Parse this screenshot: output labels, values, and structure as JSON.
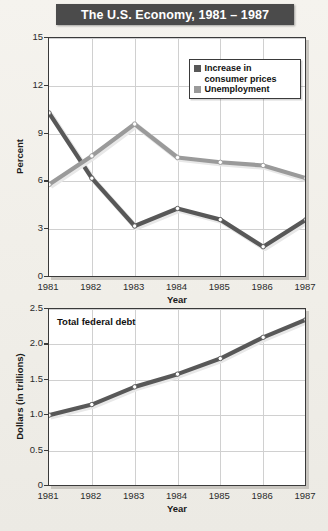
{
  "title": "The U.S. Economy, 1981 – 1987",
  "colors": {
    "consumer_prices": "#585858",
    "unemployment": "#9a9a9a",
    "federal_debt": "#585858",
    "banner_bg": "#4b4b4b",
    "banner_text": "#ffffff",
    "page_bg": "#f1efe9",
    "grid": "#d0d0d0",
    "frame": "#3a3a3a"
  },
  "legend": {
    "items": [
      {
        "label": "Increase in\nconsumer prices",
        "color_key": "consumer_prices"
      },
      {
        "label": "Unemployment",
        "color_key": "unemployment"
      }
    ]
  },
  "chart_data": [
    {
      "id": "economy-indicators",
      "type": "line",
      "title": "The U.S. Economy, 1981 – 1987",
      "xlabel": "Year",
      "ylabel": "Percent",
      "categories": [
        "1981",
        "1982",
        "1983",
        "1984",
        "1985",
        "1986",
        "1987"
      ],
      "x": [
        1981,
        1982,
        1983,
        1984,
        1985,
        1986,
        1987
      ],
      "ylim": [
        0,
        15
      ],
      "yticks": [
        "0",
        "3",
        "6",
        "9",
        "12",
        "15"
      ],
      "ytick_values": [
        0,
        3,
        6,
        9,
        12,
        15
      ],
      "grid": true,
      "legend_position": "top-right",
      "series": [
        {
          "name": "Increase in consumer prices",
          "values": [
            10.3,
            6.2,
            3.2,
            4.3,
            3.6,
            1.9,
            3.6
          ]
        },
        {
          "name": "Unemployment",
          "values": [
            5.8,
            7.6,
            9.6,
            7.5,
            7.2,
            7.0,
            6.2
          ]
        }
      ]
    },
    {
      "id": "total-federal-debt",
      "type": "line",
      "title": "Total federal debt",
      "xlabel": "Year",
      "ylabel": "Dollars (in trillions)",
      "categories": [
        "1981",
        "1982",
        "1983",
        "1984",
        "1985",
        "1986",
        "1987"
      ],
      "x": [
        1981,
        1982,
        1983,
        1984,
        1985,
        1986,
        1987
      ],
      "ylim": [
        0,
        2.5
      ],
      "yticks": [
        "0",
        "0.5",
        "1.0",
        "1.5",
        "2.0",
        "2.5"
      ],
      "ytick_values": [
        0,
        0.5,
        1.0,
        1.5,
        2.0,
        2.5
      ],
      "grid": true,
      "legend_position": "none",
      "series": [
        {
          "name": "Total federal debt",
          "values": [
            1.0,
            1.15,
            1.4,
            1.58,
            1.8,
            2.1,
            2.35
          ]
        }
      ]
    }
  ]
}
